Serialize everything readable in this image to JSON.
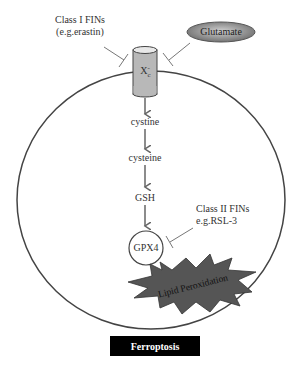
{
  "title": "Ferroptosis",
  "inhibitors": {
    "class1": {
      "line1": "Class I FINs",
      "line2": "(e.g.erastin)"
    },
    "class2": {
      "line1": "Class II FINs",
      "line2": "e.g.RSL-3"
    }
  },
  "glutamate": "Glutamate",
  "transporter": {
    "base": "X",
    "sub": "c",
    "sup": "-"
  },
  "pathway": [
    "cystine",
    "cysteine",
    "GSH"
  ],
  "enzyme": "GPX4",
  "outcome": "Lipid Peroxidation",
  "colors": {
    "cell_outline": "#444444",
    "transporter_fill": "#b8b8b8",
    "burst_fill": "#555555",
    "glutamate_fill": "#8a8a8a",
    "arrow": "#666666"
  }
}
